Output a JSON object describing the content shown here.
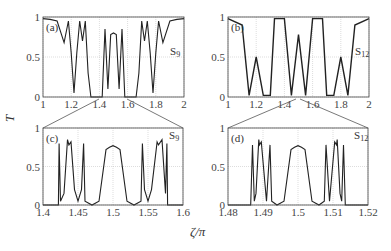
{
  "chart_data": [
    {
      "panel": "(a)",
      "type": "line",
      "series_label": "S9",
      "xlim": [
        1,
        2
      ],
      "ylim": [
        0,
        1
      ],
      "xticks": [
        "1",
        "1.2",
        "1.4",
        "1.6",
        "1.8",
        "2"
      ],
      "yticks": [
        "0",
        "0.5",
        "1"
      ],
      "grid": true,
      "description": "Transmission of Fibonacci-like sequence S9 over zeta/pi from 1 to 2; near 1 at edges, dips to 0 at bands around 1.22, 1.33-1.42, 1.58-1.67, 1.78; central band 1.42-1.58 with peaks up to ~0.85",
      "x": [
        1.0,
        1.05,
        1.1,
        1.15,
        1.18,
        1.2,
        1.22,
        1.24,
        1.26,
        1.28,
        1.3,
        1.32,
        1.34,
        1.4,
        1.42,
        1.44,
        1.46,
        1.48,
        1.5,
        1.52,
        1.54,
        1.56,
        1.58,
        1.6,
        1.66,
        1.68,
        1.7,
        1.72,
        1.74,
        1.76,
        1.78,
        1.8,
        1.82,
        1.85,
        1.9,
        1.95,
        2.0
      ],
      "y": [
        0.98,
        0.97,
        0.95,
        0.68,
        0.95,
        0.55,
        0.05,
        0.55,
        0.95,
        0.7,
        0.95,
        0.3,
        0.0,
        0.0,
        0.0,
        0.85,
        0.1,
        0.78,
        0.8,
        0.78,
        0.1,
        0.85,
        0.0,
        0.0,
        0.0,
        0.3,
        0.95,
        0.7,
        0.95,
        0.55,
        0.05,
        0.55,
        0.95,
        0.68,
        0.95,
        0.97,
        0.98
      ]
    },
    {
      "panel": "(b)",
      "type": "line",
      "series_label": "S12",
      "xlim": [
        1,
        2
      ],
      "ylim": [
        0,
        1
      ],
      "xticks": [
        "1",
        "1.2",
        "1.4",
        "1.6",
        "1.8",
        "2"
      ],
      "yticks": [
        "0",
        "0.5",
        "1"
      ],
      "grid": true,
      "description": "Transmission for S12, dense rapid oscillations; bands near 1.15-1.32, 1.42-1.58, 1.68-1.85 drop to 0; central peaks ~0.8",
      "x": [
        1.0,
        1.1,
        1.15,
        1.2,
        1.25,
        1.3,
        1.33,
        1.4,
        1.45,
        1.5,
        1.55,
        1.6,
        1.67,
        1.7,
        1.75,
        1.8,
        1.85,
        1.9,
        2.0
      ],
      "y": [
        0.98,
        0.9,
        0.02,
        0.5,
        0.02,
        0.02,
        0.98,
        0.98,
        0.02,
        0.78,
        0.02,
        0.98,
        0.98,
        0.02,
        0.02,
        0.5,
        0.02,
        0.9,
        0.98
      ]
    },
    {
      "panel": "(c)",
      "type": "line",
      "series_label": "S9",
      "xlim": [
        1.4,
        1.6
      ],
      "ylim": [
        0,
        1
      ],
      "xticks": [
        "1.4",
        "1.45",
        "1.5",
        "1.55",
        "1.6"
      ],
      "yticks": [
        "0",
        "0.5",
        "1"
      ],
      "grid": true,
      "description": "Zoom of (a) between 1.4 and 1.6; symmetric peaks about 1.5",
      "x": [
        1.4,
        1.422,
        1.423,
        1.425,
        1.43,
        1.435,
        1.437,
        1.44,
        1.445,
        1.45,
        1.455,
        1.458,
        1.46,
        1.47,
        1.48,
        1.49,
        1.495,
        1.5,
        1.505,
        1.51,
        1.52,
        1.53,
        1.54,
        1.542,
        1.545,
        1.55,
        1.555,
        1.563,
        1.565,
        1.57,
        1.575,
        1.577,
        1.578,
        1.6
      ],
      "y": [
        0.0,
        0.0,
        0.8,
        0.05,
        0.15,
        0.85,
        0.78,
        0.82,
        0.2,
        0.05,
        0.2,
        0.8,
        0.05,
        0.0,
        0.05,
        0.72,
        0.75,
        0.77,
        0.75,
        0.72,
        0.05,
        0.0,
        0.05,
        0.8,
        0.2,
        0.05,
        0.2,
        0.82,
        0.78,
        0.85,
        0.15,
        0.8,
        0.0,
        0.0
      ]
    },
    {
      "panel": "(d)",
      "type": "line",
      "series_label": "S12",
      "xlim": [
        1.48,
        1.52
      ],
      "ylim": [
        0,
        1
      ],
      "xticks": [
        "1.48",
        "1.49",
        "1.5",
        "1.51",
        "1.52"
      ],
      "yticks": [
        "0",
        "0.5",
        "1"
      ],
      "grid": true,
      "description": "Zoom of (b) between 1.48 and 1.52; pattern self-similar to (c)",
      "x": [
        1.48,
        1.4865,
        1.487,
        1.4875,
        1.488,
        1.4888,
        1.489,
        1.4895,
        1.491,
        1.492,
        1.4925,
        1.494,
        1.496,
        1.498,
        1.499,
        1.5,
        1.501,
        1.502,
        1.504,
        1.506,
        1.5075,
        1.508,
        1.509,
        1.5105,
        1.511,
        1.5112,
        1.512,
        1.5125,
        1.513,
        1.5135,
        1.52
      ],
      "y": [
        0.0,
        0.0,
        0.78,
        0.05,
        0.15,
        0.85,
        0.78,
        0.82,
        0.05,
        0.78,
        0.05,
        0.0,
        0.05,
        0.72,
        0.75,
        0.77,
        0.75,
        0.72,
        0.05,
        0.0,
        0.05,
        0.78,
        0.05,
        0.82,
        0.78,
        0.85,
        0.15,
        0.05,
        0.78,
        0.0,
        0.0
      ]
    }
  ],
  "labels": {
    "ylabel": "T",
    "xlabel": "ζ/π",
    "panel_a": "(a)",
    "panel_b": "(b)",
    "panel_c": "(c)",
    "panel_d": "(d)",
    "seq_a": "S",
    "seq_a_sub": "9",
    "seq_b": "S",
    "seq_b_sub": "12",
    "seq_c": "S",
    "seq_c_sub": "9",
    "seq_d": "S",
    "seq_d_sub": "12"
  },
  "ticks": {
    "a_x": [
      "1",
      "1.2",
      "1.4",
      "1.6",
      "1.8",
      "2"
    ],
    "b_x": [
      "1",
      "1.2",
      "1.4",
      "1.6",
      "1.8",
      "2"
    ],
    "c_x": [
      "1.4",
      "1.45",
      "1.5",
      "1.55",
      "1.6"
    ],
    "d_x": [
      "1.48",
      "1.49",
      "1.5",
      "1.51",
      "1.52"
    ],
    "y": [
      "0",
      "0.5",
      "1"
    ]
  },
  "colors": {
    "line": "#222222",
    "grid": "#bbbbbb",
    "frame": "#444444"
  }
}
